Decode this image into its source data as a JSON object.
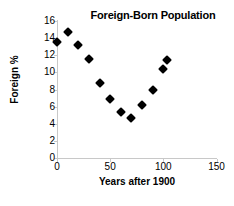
{
  "chart_data": {
    "type": "scatter",
    "title": "Foreign-Born Population",
    "xlabel": "Years after 1900",
    "ylabel": "Foreign %",
    "xlim": [
      0,
      150
    ],
    "ylim": [
      0,
      16
    ],
    "xticks": [
      0,
      50,
      100,
      150
    ],
    "yticks": [
      0,
      2,
      4,
      6,
      8,
      10,
      12,
      14,
      16
    ],
    "grid": false,
    "legend": null,
    "marker": "diamond",
    "marker_color": "#000000",
    "x": [
      0,
      10,
      20,
      30,
      40,
      50,
      60,
      70,
      80,
      90,
      100,
      103
    ],
    "y": [
      13.6,
      14.7,
      13.2,
      11.6,
      8.8,
      6.9,
      5.4,
      4.7,
      6.2,
      7.9,
      10.4,
      11.4
    ],
    "points": [
      {
        "x": 0,
        "y": 13.6
      },
      {
        "x": 10,
        "y": 14.7
      },
      {
        "x": 20,
        "y": 13.2
      },
      {
        "x": 30,
        "y": 11.6
      },
      {
        "x": 40,
        "y": 8.8
      },
      {
        "x": 50,
        "y": 6.9
      },
      {
        "x": 60,
        "y": 5.4
      },
      {
        "x": 70,
        "y": 4.7
      },
      {
        "x": 80,
        "y": 6.2
      },
      {
        "x": 90,
        "y": 7.9
      },
      {
        "x": 100,
        "y": 10.4
      },
      {
        "x": 103,
        "y": 11.4
      }
    ]
  },
  "axis": {
    "y_tick_labels": [
      "16",
      "14",
      "12",
      "10",
      "8",
      "6",
      "4",
      "2",
      "0"
    ],
    "x_tick_labels": [
      "0",
      "50",
      "100",
      "150"
    ]
  },
  "colors": {
    "axis": "#c8c8c8",
    "marker": "#000000",
    "text": "#000000",
    "background": "#ffffff"
  }
}
